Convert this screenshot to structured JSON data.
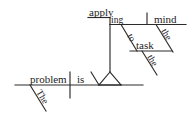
{
  "diagram": {
    "type": "reed-kellogg-sentence-diagram",
    "sentence": "The problem is applying the mind to the task.",
    "ink_color": "#2b2b2b",
    "text_color": "#1c1c1c",
    "background_color": "#ffffff",
    "words": {
      "subject": "problem",
      "subject_article": "The",
      "verb": "is",
      "gerund_stem": "apply",
      "gerund_suffix": "ing",
      "gerund_object": "mind",
      "gerund_object_article": "the",
      "preposition": "to",
      "prep_object": "task",
      "prep_object_article": "the"
    },
    "labels": {
      "baseline": "main clause baseline",
      "pedestal": "gerund pedestal",
      "gerund_line": "gerund phrase line"
    }
  }
}
